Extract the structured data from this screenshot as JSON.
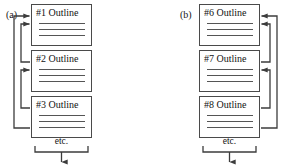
{
  "figure": {
    "caption_labels": [
      "(a)",
      "(b)"
    ],
    "line_color": "#4a4a4a",
    "rule_color": "#555555",
    "arrow_color": "#3c3c3c",
    "background": "#ffffff"
  },
  "panels": [
    {
      "id": "a",
      "label": "(a)",
      "arrow_side": "left",
      "boxes": [
        {
          "title": "#1 Outline",
          "rules": 3
        },
        {
          "title": "#2 Outline",
          "rules": 3
        },
        {
          "title": "#3 Outline",
          "rules": 3
        }
      ],
      "footer": {
        "label": "etc."
      }
    },
    {
      "id": "b",
      "label": "(b)",
      "arrow_side": "right",
      "boxes": [
        {
          "title": "#6 Outline",
          "rules": 3
        },
        {
          "title": "#7 Outline",
          "rules": 3
        },
        {
          "title": "#8 Outline",
          "rules": 3
        }
      ],
      "footer": {
        "label": "etc."
      }
    }
  ]
}
